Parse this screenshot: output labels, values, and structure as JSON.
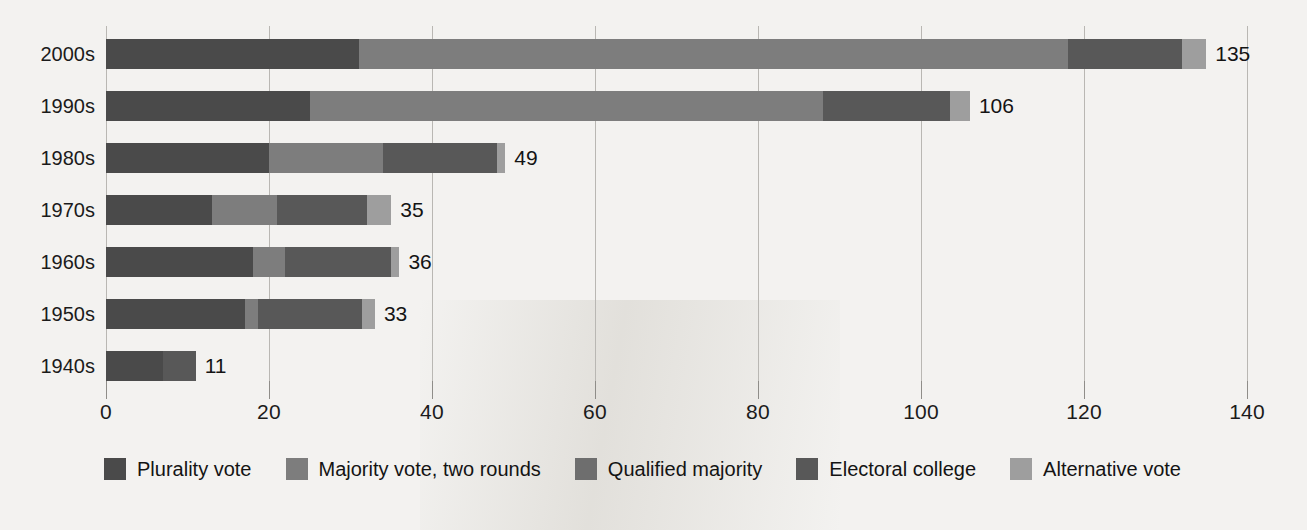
{
  "chart_data": {
    "type": "bar",
    "orientation": "horizontal",
    "stacked": true,
    "title": "",
    "xlabel": "",
    "ylabel": "",
    "xlim": [
      0,
      140
    ],
    "xticks": [
      0,
      20,
      40,
      60,
      80,
      100,
      120,
      140
    ],
    "grid": true,
    "legend_position": "bottom",
    "categories": [
      "2000s",
      "1990s",
      "1980s",
      "1970s",
      "1960s",
      "1950s",
      "1940s"
    ],
    "series": [
      {
        "name": "Plurality vote",
        "color": "#4a4a4a",
        "values": [
          31,
          25,
          20,
          13,
          18,
          17,
          7
        ]
      },
      {
        "name": "Majority vote, two rounds",
        "color": "#7d7d7d",
        "values": [
          87,
          63,
          14,
          8,
          4,
          2,
          0
        ]
      },
      {
        "name": "Qualified majority",
        "color": "#6e6e6e",
        "values": [
          0,
          0,
          0,
          0,
          0,
          0,
          0
        ]
      },
      {
        "name": "Electoral college",
        "color": "#585858",
        "values": [
          14,
          15.5,
          14,
          11,
          13,
          12.5,
          4
        ]
      },
      {
        "name": "Alternative vote",
        "color": "#9e9e9e",
        "values": [
          3,
          2.5,
          1,
          3,
          1,
          1.5,
          0
        ]
      }
    ],
    "totals": [
      135,
      106,
      49,
      35,
      36,
      33,
      11
    ],
    "total_labels": [
      "135",
      "106",
      "49",
      "35",
      "36",
      "33",
      "11"
    ],
    "bars": [
      {
        "category": "2000s",
        "total": 135,
        "total_label": "135",
        "segments": [
          {
            "series": "Plurality vote",
            "start": 0,
            "end": 31,
            "color": "#4a4a4a"
          },
          {
            "series": "Majority vote, two rounds",
            "start": 31,
            "end": 118,
            "color": "#7d7d7d"
          },
          {
            "series": "Electoral college",
            "start": 118,
            "end": 132,
            "color": "#585858"
          },
          {
            "series": "Alternative vote",
            "start": 132,
            "end": 135,
            "color": "#9e9e9e"
          }
        ]
      },
      {
        "category": "1990s",
        "total": 106,
        "total_label": "106",
        "segments": [
          {
            "series": "Plurality vote",
            "start": 0,
            "end": 25,
            "color": "#4a4a4a"
          },
          {
            "series": "Majority vote, two rounds",
            "start": 25,
            "end": 88,
            "color": "#7d7d7d"
          },
          {
            "series": "Electoral college",
            "start": 88,
            "end": 103.5,
            "color": "#585858"
          },
          {
            "series": "Alternative vote",
            "start": 103.5,
            "end": 106,
            "color": "#9e9e9e"
          }
        ]
      },
      {
        "category": "1980s",
        "total": 49,
        "total_label": "49",
        "segments": [
          {
            "series": "Plurality vote",
            "start": 0,
            "end": 20,
            "color": "#4a4a4a"
          },
          {
            "series": "Majority vote, two rounds",
            "start": 20,
            "end": 34,
            "color": "#7d7d7d"
          },
          {
            "series": "Electoral college",
            "start": 34,
            "end": 48,
            "color": "#585858"
          },
          {
            "series": "Alternative vote",
            "start": 48,
            "end": 49,
            "color": "#9e9e9e"
          }
        ]
      },
      {
        "category": "1970s",
        "total": 35,
        "total_label": "35",
        "segments": [
          {
            "series": "Plurality vote",
            "start": 0,
            "end": 13,
            "color": "#4a4a4a"
          },
          {
            "series": "Majority vote, two rounds",
            "start": 13,
            "end": 21,
            "color": "#7d7d7d"
          },
          {
            "series": "Electoral college",
            "start": 21,
            "end": 32,
            "color": "#585858"
          },
          {
            "series": "Alternative vote",
            "start": 32,
            "end": 35,
            "color": "#9e9e9e"
          }
        ]
      },
      {
        "category": "1960s",
        "total": 36,
        "total_label": "36",
        "segments": [
          {
            "series": "Plurality vote",
            "start": 0,
            "end": 18,
            "color": "#4a4a4a"
          },
          {
            "series": "Majority vote, two rounds",
            "start": 18,
            "end": 22,
            "color": "#7d7d7d"
          },
          {
            "series": "Electoral college",
            "start": 22,
            "end": 35,
            "color": "#585858"
          },
          {
            "series": "Alternative vote",
            "start": 35,
            "end": 36,
            "color": "#9e9e9e"
          }
        ]
      },
      {
        "category": "1950s",
        "total": 33,
        "total_label": "33",
        "segments": [
          {
            "series": "Plurality vote",
            "start": 0,
            "end": 17,
            "color": "#4a4a4a"
          },
          {
            "series": "Majority vote, two rounds",
            "start": 17,
            "end": 18.7,
            "color": "#7d7d7d"
          },
          {
            "series": "Electoral college",
            "start": 18.7,
            "end": 31.4,
            "color": "#585858"
          },
          {
            "series": "Alternative vote",
            "start": 31.4,
            "end": 33,
            "color": "#9e9e9e"
          }
        ]
      },
      {
        "category": "1940s",
        "total": 11,
        "total_label": "11",
        "segments": [
          {
            "series": "Plurality vote",
            "start": 0,
            "end": 7,
            "color": "#4a4a4a"
          },
          {
            "series": "Electoral college",
            "start": 7,
            "end": 11,
            "color": "#585858"
          }
        ]
      }
    ]
  },
  "axis": {
    "x_tick_labels": [
      "0",
      "20",
      "40",
      "60",
      "80",
      "100",
      "120",
      "140"
    ],
    "y_tick_labels": [
      "2000s",
      "1990s",
      "1980s",
      "1970s",
      "1960s",
      "1950s",
      "1940s"
    ]
  },
  "legend": {
    "items": [
      {
        "label": "Plurality vote",
        "color": "#4a4a4a"
      },
      {
        "label": "Majority vote, two rounds",
        "color": "#7d7d7d"
      },
      {
        "label": "Qualified majority",
        "color": "#6e6e6e"
      },
      {
        "label": "Electoral college",
        "color": "#585858"
      },
      {
        "label": "Alternative vote",
        "color": "#9e9e9e"
      }
    ]
  },
  "colors": {
    "background": "#f3f2f0",
    "gridline": "#b9b7b3",
    "text": "#141414"
  }
}
